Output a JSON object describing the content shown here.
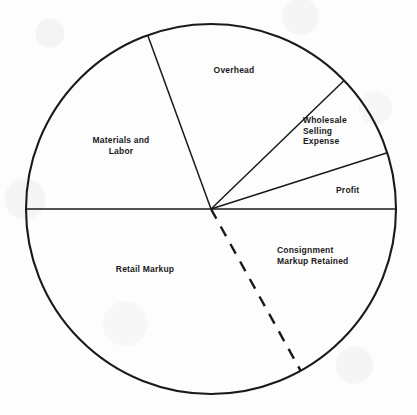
{
  "figure": {
    "type": "pie-chart",
    "background_color": "#fdfdfd",
    "line_color": "#1a1a1a",
    "label_color": "#1a1a1a"
  },
  "labels": {
    "overhead": "Overhead",
    "materials_and_labor": "Materials and\nLabor",
    "wholesale_selling_expense": "Wholesale\nSelling\nExpense",
    "profit": "Profit",
    "consignment_markup_retained": "Consignment\nMarkup Retained",
    "retail_markup": "Retail Markup"
  },
  "chart_data": {
    "type": "pie",
    "title": "",
    "subtitle": "",
    "xlabel": "",
    "ylabel": "",
    "legend_position": "inside-slices",
    "grid": false,
    "center_x": 211,
    "center_y": 209,
    "radius": 185,
    "start_angle_deg": 180,
    "direction": "clockwise",
    "categories": [
      "Materials and Labor",
      "Overhead",
      "Wholesale Selling Expense",
      "Profit",
      "Consignment Markup Retained",
      "Retail Markup"
    ],
    "values": [
      19.4,
      18.3,
      7.3,
      4.9,
      33.9,
      16.2
    ],
    "slices": [
      {
        "name": "Materials and Labor",
        "start_angle_deg": 180,
        "end_angle_deg": 110,
        "sweep_deg": 70,
        "percent": 19.4,
        "label": "Materials and\nLabor",
        "label_x": 120,
        "label_y": 143,
        "fill": "none"
      },
      {
        "name": "Overhead",
        "start_angle_deg": 110,
        "end_angle_deg": 44,
        "sweep_deg": 66,
        "percent": 18.3,
        "label": "Overhead",
        "label_x": 233,
        "label_y": 72,
        "fill": "none"
      },
      {
        "name": "Wholesale Selling Expense",
        "start_angle_deg": 44,
        "end_angle_deg": 17.7,
        "sweep_deg": 26.3,
        "percent": 7.3,
        "label": "Wholesale\nSelling\nExpense",
        "label_x": 337,
        "label_y": 136,
        "fill": "none"
      },
      {
        "name": "Profit",
        "start_angle_deg": 17.7,
        "end_angle_deg": 0,
        "sweep_deg": 17.7,
        "percent": 4.9,
        "label": "Profit",
        "label_x": 350,
        "label_y": 191,
        "fill": "none"
      },
      {
        "name": "Consignment Markup Retained",
        "start_angle_deg": 0,
        "end_angle_deg": -61,
        "sweep_deg": 61,
        "percent": 16.9,
        "label": "Consignment\nMarkup Retained",
        "label_x": 318,
        "label_y": 258,
        "fill": "none"
      },
      {
        "name": "Retail Markup",
        "start_angle_deg": -61,
        "end_angle_deg": -180,
        "sweep_deg": 119,
        "percent": 33.1,
        "label": "Retail Markup",
        "label_x": 145,
        "label_y": 270,
        "fill": "none"
      }
    ],
    "divider_lines": [
      {
        "name": "horizontal-diameter",
        "angle_deg": 180,
        "style": "solid",
        "full_diameter": true
      },
      {
        "name": "materials-overhead-divider",
        "angle_deg": 110,
        "style": "solid"
      },
      {
        "name": "overhead-wholesale-divider",
        "angle_deg": 44,
        "style": "solid"
      },
      {
        "name": "wholesale-profit-divider",
        "angle_deg": 17.7,
        "style": "solid"
      },
      {
        "name": "retail-consignment-divider",
        "angle_deg": -61,
        "style": "dashed"
      }
    ]
  }
}
